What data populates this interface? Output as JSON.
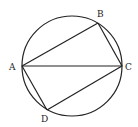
{
  "diagram": {
    "type": "cyclic-quadrilateral",
    "circle": {
      "cx": 72,
      "cy": 66,
      "r": 50
    },
    "points": {
      "A": {
        "label": "A",
        "x": 22,
        "y": 66
      },
      "B": {
        "label": "B",
        "x": 98,
        "y": 23
      },
      "C": {
        "label": "C",
        "x": 122,
        "y": 66
      },
      "D": {
        "label": "D",
        "x": 47,
        "y": 110
      }
    },
    "segments": [
      "AB",
      "BC",
      "CD",
      "DA",
      "AC"
    ],
    "stroke_color": "#222222"
  }
}
